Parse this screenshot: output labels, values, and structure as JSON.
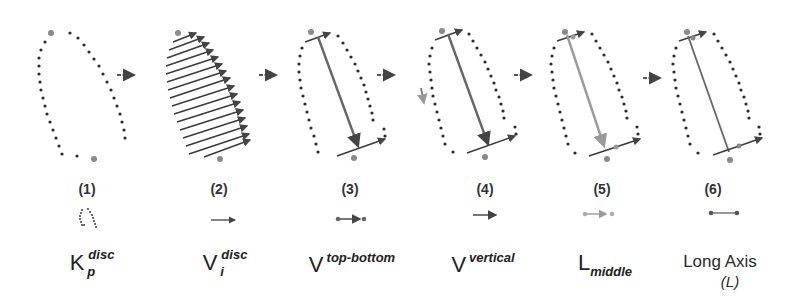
{
  "diagram": {
    "colors": {
      "dots": "#2b2b2b",
      "anchor_point": "#808080",
      "vector_dark": "#555555",
      "vector_light": "#9a9a9a",
      "arrow": "#555555"
    },
    "steps": [
      {
        "number": "(1)",
        "symbol_main": "K",
        "symbol_sup": "disc",
        "symbol_sub": "p",
        "icon": "dotted-contour-icon"
      },
      {
        "number": "(2)",
        "symbol_main": "V",
        "symbol_sup": "disc",
        "symbol_sub": "i",
        "icon": "arrow-vector-icon"
      },
      {
        "number": "(3)",
        "symbol_main": "V",
        "symbol_sup": "top-bottom",
        "symbol_sub": "",
        "icon": "dot-arrow-dot-icon"
      },
      {
        "number": "(4)",
        "symbol_main": "V",
        "symbol_sup": "vertical",
        "symbol_sub": "",
        "icon": "arrow-vector-icon"
      },
      {
        "number": "(5)",
        "symbol_main": "L",
        "symbol_sup": "",
        "symbol_sub": "middle",
        "icon": "light-dot-arrow-dot-icon"
      },
      {
        "number": "(6)",
        "symbol_main": "Long Axis",
        "symbol_line2": "(L)",
        "icon": "dot-line-dot-icon"
      }
    ],
    "flow_arrows": 5
  }
}
